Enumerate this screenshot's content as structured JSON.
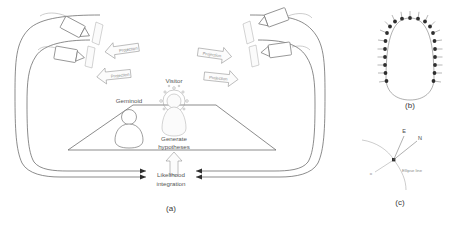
{
  "figure": {
    "background": "#ffffff",
    "ink": "#5a5a5a",
    "panels": [
      {
        "id": "a",
        "caption": "(a)"
      },
      {
        "id": "b",
        "caption": "(b)"
      },
      {
        "id": "c",
        "caption": "(c)"
      }
    ]
  },
  "panel_a": {
    "caption": "(a)",
    "labels": {
      "geminoid": "Geminoid",
      "visitor": "Visitor",
      "generate_hypotheses_line1": "Generate",
      "generate_hypotheses_line2": "hypotheses",
      "likelihood_line1": "Likelihood",
      "likelihood_line2": "integration"
    },
    "projection_arrows": [
      {
        "id": "left-upper",
        "label": "Projection",
        "direction": "left"
      },
      {
        "id": "left-lower",
        "label": "Projection",
        "direction": "left"
      },
      {
        "id": "right-upper",
        "label": "Projection",
        "direction": "right"
      },
      {
        "id": "right-lower",
        "label": "Projection",
        "direction": "right"
      }
    ],
    "projectors": [
      {
        "id": "projector-left-upper"
      },
      {
        "id": "projector-left-lower"
      },
      {
        "id": "projector-right-upper"
      },
      {
        "id": "projector-right-lower"
      }
    ],
    "feedback_arrows": [
      {
        "id": "feedback-left-outer",
        "direction": "right"
      },
      {
        "id": "feedback-left-inner",
        "direction": "right"
      },
      {
        "id": "feedback-right-outer",
        "direction": "left"
      },
      {
        "id": "feedback-right-inner",
        "direction": "left"
      }
    ]
  },
  "panel_b": {
    "caption": "(b)",
    "sensor_count": 21,
    "shape": "u-shaped camera ring"
  },
  "panel_c": {
    "caption": "(c)",
    "labels": {
      "east": "E",
      "north": "N",
      "ellipse_line": "Ellipse line",
      "origin": "o"
    }
  }
}
